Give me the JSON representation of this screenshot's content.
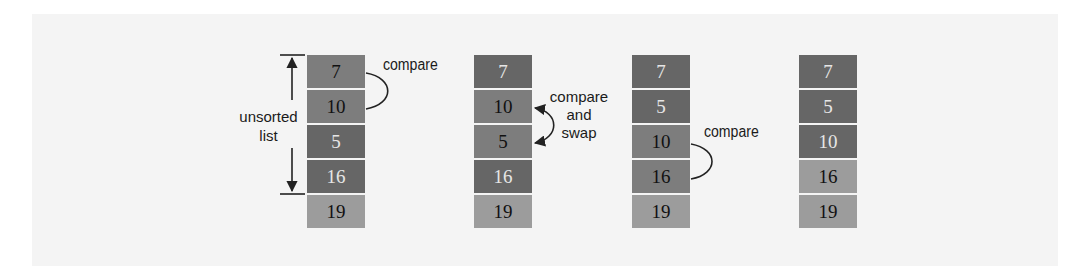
{
  "diagram": {
    "type": "bubble-sort-steps",
    "range_label_lines": [
      "unsorted",
      "list"
    ],
    "steps": [
      {
        "cells": [
          {
            "value": "7",
            "shade": "mid"
          },
          {
            "value": "10",
            "shade": "mid"
          },
          {
            "value": "5",
            "shade": "dark"
          },
          {
            "value": "16",
            "shade": "dark"
          },
          {
            "value": "19",
            "shade": "light"
          }
        ],
        "annotation": [
          "compare"
        ]
      },
      {
        "cells": [
          {
            "value": "7",
            "shade": "dark"
          },
          {
            "value": "10",
            "shade": "mid"
          },
          {
            "value": "5",
            "shade": "mid"
          },
          {
            "value": "16",
            "shade": "dark"
          },
          {
            "value": "19",
            "shade": "light"
          }
        ],
        "annotation": [
          "compare",
          "and",
          "swap"
        ]
      },
      {
        "cells": [
          {
            "value": "7",
            "shade": "dark"
          },
          {
            "value": "5",
            "shade": "dark"
          },
          {
            "value": "10",
            "shade": "mid"
          },
          {
            "value": "16",
            "shade": "mid"
          },
          {
            "value": "19",
            "shade": "light"
          }
        ],
        "annotation": [
          "compare"
        ]
      },
      {
        "cells": [
          {
            "value": "7",
            "shade": "dark"
          },
          {
            "value": "5",
            "shade": "dark"
          },
          {
            "value": "10",
            "shade": "dark"
          },
          {
            "value": "16",
            "shade": "light"
          },
          {
            "value": "19",
            "shade": "light"
          }
        ],
        "annotation": []
      }
    ],
    "colors": {
      "dark": "#666666",
      "mid": "#7d7d7d",
      "light": "#9c9c9c",
      "separator": "#e0e0e0",
      "text_dark": "#111111",
      "text_light": "#e6e6e6"
    }
  }
}
